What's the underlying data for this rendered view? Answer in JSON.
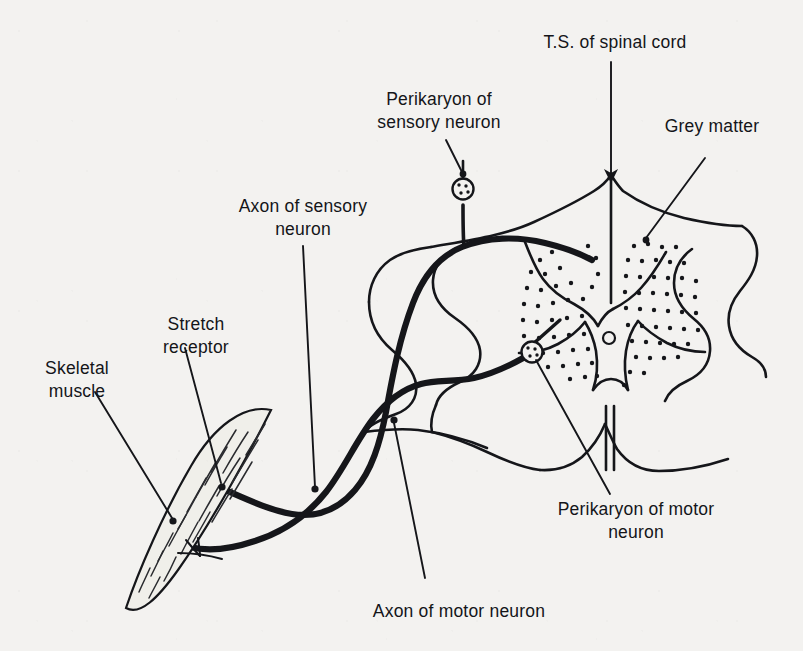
{
  "figure": {
    "background_color": "#f3f2f0",
    "ink_color": "#15161a"
  },
  "labels": {
    "spinal_cord": {
      "line1": "T.S. of spinal cord"
    },
    "grey_matter": {
      "line1": "Grey matter"
    },
    "perikaryon_sensory": {
      "line1": "Perikaryon of",
      "line2": "sensory neuron"
    },
    "axon_sensory": {
      "line1": "Axon of sensory",
      "line2": "neuron"
    },
    "stretch_receptor": {
      "line1": "Stretch",
      "line2": "receptor"
    },
    "skeletal_muscle": {
      "line1": "Skeletal",
      "line2": "muscle"
    },
    "perikaryon_motor": {
      "line1": "Perikaryon of motor",
      "line2": "neuron"
    },
    "axon_motor": {
      "line1": "Axon of motor neuron"
    }
  },
  "parts": {
    "cord_outline": "white-matter-boundary",
    "grey_matter": "butterfly-shaped-stippled-region",
    "central_canal": "small-open-circle",
    "sensory_cell_body": "dorsal-root-ganglion-cell",
    "motor_cell_body": "ventral-horn-motor-neuron",
    "muscle": "spindle-shaped-skeletal-muscle",
    "receptor": "stretch-receptor-terminal"
  }
}
